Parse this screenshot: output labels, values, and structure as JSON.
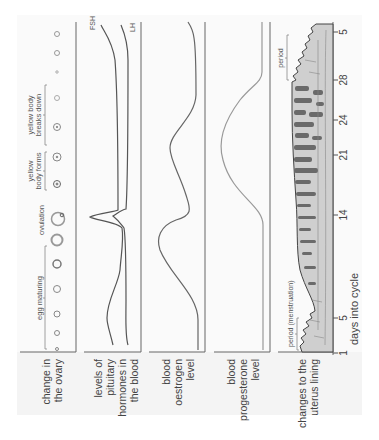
{
  "row_labels": {
    "ovary": [
      "change in",
      "the ovary"
    ],
    "hormones": [
      "levels of",
      "pituitary",
      "hormones in",
      "the blood"
    ],
    "oestrogen": [
      "blood",
      "oestrogen",
      "level"
    ],
    "progesterone": [
      "blood",
      "progesterone",
      "level"
    ],
    "uterus": [
      "changes to the",
      "uterus lining"
    ]
  },
  "axis": {
    "label": "days into cycle",
    "ticks": [
      "1",
      "5",
      "14",
      "21",
      "24",
      "28",
      "5"
    ]
  },
  "ovary_annotations": {
    "egg_maturing": "egg maturing",
    "ovulation": "ovulation",
    "yellow_body_forms": [
      "yellow",
      "body forms"
    ],
    "yellow_body_breaks_down": [
      "yellow body",
      "breaks down"
    ]
  },
  "hormone_labels": {
    "fsh": "FSH",
    "lh": "LH"
  },
  "uterus_annotations": {
    "period_start": "period (menstruation)",
    "period_end": "period"
  },
  "colors": {
    "line": "#555555",
    "light_line": "#888888",
    "label_bg": "#f4f4f4",
    "uterus_fill": "#c9c9c9",
    "uterus_dark": "#6a6a6a"
  }
}
